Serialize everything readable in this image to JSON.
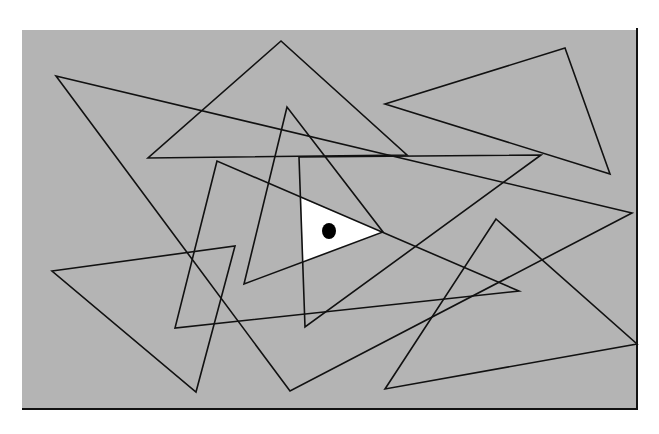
{
  "figure": {
    "background_color": "#b4b4b4",
    "page_color": "#ffffff",
    "stroke_color": "#111111",
    "highlight_color": "#ffffff",
    "dot_color": "#000000",
    "panel": {
      "x": 22,
      "y": 30,
      "width": 615,
      "height": 379
    },
    "triangles": [
      {
        "id": "A",
        "points": [
          [
            281,
            41
          ],
          [
            148,
            158
          ],
          [
            407,
            155
          ]
        ]
      },
      {
        "id": "B",
        "points": [
          [
            56,
            76
          ],
          [
            632,
            213
          ],
          [
            290,
            391
          ]
        ]
      },
      {
        "id": "C",
        "points": [
          [
            287,
            107
          ],
          [
            244,
            284
          ],
          [
            383,
            232
          ]
        ]
      },
      {
        "id": "D",
        "points": [
          [
            217,
            161
          ],
          [
            175,
            328
          ],
          [
            519,
            291
          ]
        ]
      },
      {
        "id": "E",
        "points": [
          [
            565,
            48
          ],
          [
            385,
            104
          ],
          [
            610,
            174
          ]
        ]
      },
      {
        "id": "F",
        "points": [
          [
            52,
            271
          ],
          [
            235,
            246
          ],
          [
            196,
            392
          ]
        ]
      },
      {
        "id": "G",
        "points": [
          [
            496,
            219
          ],
          [
            637,
            344
          ],
          [
            385,
            389
          ]
        ]
      },
      {
        "id": "H",
        "points": [
          [
            299,
            157
          ],
          [
            541,
            155
          ],
          [
            305,
            327
          ]
        ]
      }
    ],
    "white_region": {
      "points": [
        [
          301,
          198
        ],
        [
          383,
          232
        ],
        [
          303,
          262
        ]
      ]
    },
    "dot": {
      "cx": 329,
      "cy": 231,
      "r": 8
    }
  }
}
